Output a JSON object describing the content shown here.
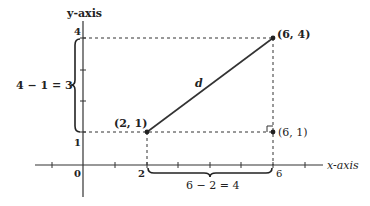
{
  "diagram": {
    "axes": {
      "x_label": "x-axis",
      "y_label": "y-axis",
      "x_ticks": [
        "0",
        "2",
        "6"
      ],
      "y_ticks": [
        "1",
        "4"
      ]
    },
    "points": {
      "p1": "(2, 1)",
      "p2": "(6, 4)",
      "p3": "(6, 1)"
    },
    "segment_label": "d",
    "vertical_brace_label": "4 − 1 = 3",
    "horizontal_brace_label": "6 − 2 = 4"
  }
}
